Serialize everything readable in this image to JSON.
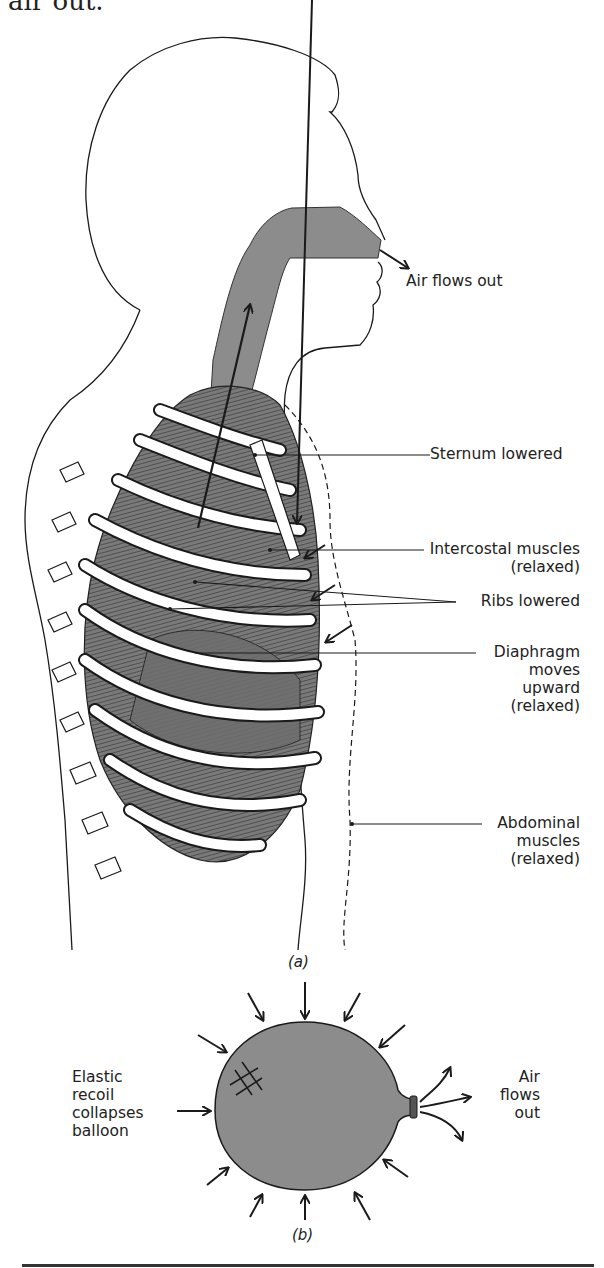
{
  "header": {
    "text_fragment": "air out."
  },
  "figure_a": {
    "caption": "(a)",
    "labels": {
      "air_out": "Air flows out",
      "sternum": "Sternum lowered",
      "intercostal_1": "Intercostal muscles",
      "intercostal_2": "(relaxed)",
      "ribs": "Ribs lowered",
      "diaphragm_1": "Diaphragm",
      "diaphragm_2": "moves",
      "diaphragm_3": "upward",
      "diaphragm_4": "(relaxed)",
      "abdominal_1": "Abdominal",
      "abdominal_2": "muscles",
      "abdominal_3": "(relaxed)"
    }
  },
  "figure_b": {
    "caption": "(b)",
    "labels": {
      "left_1": "Elastic",
      "left_2": "recoil",
      "left_3": "collapses",
      "left_4": "balloon",
      "right_1": "Air",
      "right_2": "flows",
      "right_3": "out"
    }
  },
  "colors": {
    "fill": "#8c8c8c",
    "line": "#1a1a1a",
    "background": "#ffffff"
  }
}
